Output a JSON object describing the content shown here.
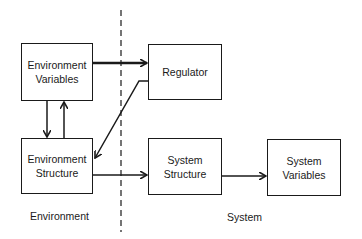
{
  "diagram": {
    "divider": {
      "style": "dashed",
      "orientation": "vertical"
    },
    "regions": [
      {
        "id": "environment",
        "label": "Environment"
      },
      {
        "id": "system",
        "label": "System"
      }
    ],
    "nodes": [
      {
        "id": "env_vars",
        "line1": "Environment",
        "line2": "Variables"
      },
      {
        "id": "env_struct",
        "line1": "Environment",
        "line2": "Structure"
      },
      {
        "id": "regulator",
        "line1": "Regulator",
        "line2": ""
      },
      {
        "id": "sys_struct",
        "line1": "System",
        "line2": "Structure"
      },
      {
        "id": "sys_vars",
        "line1": "System",
        "line2": "Variables"
      }
    ],
    "edges": [
      {
        "from": "env_vars",
        "to": "regulator",
        "weight": "thick"
      },
      {
        "from": "env_vars",
        "to": "env_struct"
      },
      {
        "from": "env_struct",
        "to": "env_vars"
      },
      {
        "from": "regulator",
        "to": "env_struct"
      },
      {
        "from": "env_struct",
        "to": "sys_struct"
      },
      {
        "from": "sys_struct",
        "to": "sys_vars"
      }
    ]
  }
}
